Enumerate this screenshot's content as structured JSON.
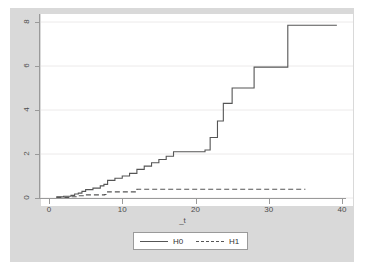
{
  "figure": {
    "background_color": "#d9d9d9",
    "plot_background_color": "#ffffff",
    "axis_color": "#9a9a9a",
    "line_color": "#555555"
  },
  "chart_data": {
    "type": "line",
    "title": "",
    "subtitle": "",
    "xlabel": "_t",
    "ylabel": "",
    "xlim": [
      0,
      40
    ],
    "ylim": [
      0,
      8
    ],
    "xticks": [
      0,
      10,
      20,
      30,
      40
    ],
    "yticks": [
      0,
      2,
      4,
      6,
      8
    ],
    "xtick_labels": [
      "0",
      "10",
      "20",
      "30",
      "40"
    ],
    "ytick_labels": [
      "0",
      "2",
      "4",
      "6",
      "8"
    ],
    "grid": "horizontal",
    "legend_position": "bottom",
    "step_style": "post",
    "series": [
      {
        "name": "H0",
        "style": "solid",
        "x": [
          1.0,
          2.0,
          3.0,
          3.5,
          4.0,
          4.5,
          5.0,
          6.0,
          7.0,
          7.5,
          8.0,
          9.0,
          10.0,
          11.0,
          12.0,
          13.0,
          14.0,
          15.0,
          16.0,
          17.0,
          21.3,
          22.0,
          23.0,
          23.8,
          25.0,
          28.0,
          32.6,
          39.3
        ],
        "y": [
          0.05,
          0.08,
          0.12,
          0.18,
          0.22,
          0.3,
          0.38,
          0.45,
          0.55,
          0.62,
          0.8,
          0.9,
          1.0,
          1.12,
          1.3,
          1.45,
          1.6,
          1.75,
          1.9,
          2.1,
          2.18,
          2.75,
          3.5,
          4.3,
          5.0,
          5.95,
          7.85,
          7.85
        ]
      },
      {
        "name": "H1",
        "style": "dashed",
        "x": [
          1.0,
          3.0,
          4.0,
          5.0,
          7.6,
          8.0,
          12.0,
          35.0
        ],
        "y": [
          0.03,
          0.06,
          0.1,
          0.14,
          0.16,
          0.28,
          0.4,
          0.4
        ]
      }
    ],
    "legend_entries": [
      {
        "label": "H0",
        "style": "solid"
      },
      {
        "label": "H1",
        "style": "dashed"
      }
    ]
  }
}
